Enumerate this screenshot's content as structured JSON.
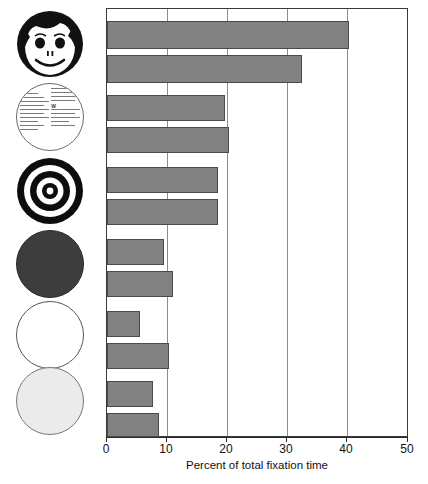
{
  "chart_data": {
    "type": "bar",
    "orientation": "horizontal",
    "title": "",
    "xlabel": "Percent of total fixation time",
    "ylabel": "",
    "xlim": [
      0,
      50
    ],
    "xticks": [
      0,
      10,
      20,
      30,
      40,
      50
    ],
    "xtick_labels": [
      "0",
      "10",
      "20",
      "30",
      "40",
      "50"
    ],
    "grid": true,
    "grid_axis": "x",
    "legend": "none",
    "categories": [
      "schematic face",
      "schematic face",
      "newsprint",
      "newsprint",
      "bullseye",
      "bullseye",
      "dark gray disk",
      "dark gray disk",
      "white disk",
      "white disk",
      "light gray disk",
      "light gray disk"
    ],
    "values": [
      40.3,
      32.5,
      19.7,
      20.3,
      18.5,
      18.5,
      9.5,
      11.0,
      5.5,
      10.3,
      7.7,
      8.7
    ],
    "bar_color": "#818181",
    "bar_edge_color": "#4a4a4a",
    "groups": [
      {
        "stimulus": "schematic-face",
        "values": [
          40.3,
          32.5
        ]
      },
      {
        "stimulus": "newsprint",
        "values": [
          19.7,
          20.3
        ]
      },
      {
        "stimulus": "bullseye",
        "values": [
          18.5,
          18.5
        ]
      },
      {
        "stimulus": "dark-gray-disk",
        "values": [
          9.5,
          11.0
        ]
      },
      {
        "stimulus": "white-disk",
        "values": [
          5.5,
          10.3
        ]
      },
      {
        "stimulus": "light-gray-disk",
        "values": [
          7.7,
          8.7
        ]
      }
    ]
  },
  "stimuli": [
    {
      "name": "schematic-face",
      "icon": "smiley-face-icon"
    },
    {
      "name": "newsprint",
      "icon": "newsprint-text-icon"
    },
    {
      "name": "bullseye",
      "icon": "bullseye-target-icon"
    },
    {
      "name": "dark-gray-disk",
      "icon": "dark-gray-circle-icon",
      "color": "#3d3d3d"
    },
    {
      "name": "white-disk",
      "icon": "white-circle-icon",
      "color": "#ffffff"
    },
    {
      "name": "light-gray-disk",
      "icon": "light-gray-circle-icon",
      "color": "#ebebeb"
    }
  ],
  "newsprint_caps": [
    "W",
    "d"
  ],
  "axis": {
    "label": "Percent of total fixation time",
    "ticks": [
      "0",
      "10",
      "20",
      "30",
      "40",
      "50"
    ]
  }
}
